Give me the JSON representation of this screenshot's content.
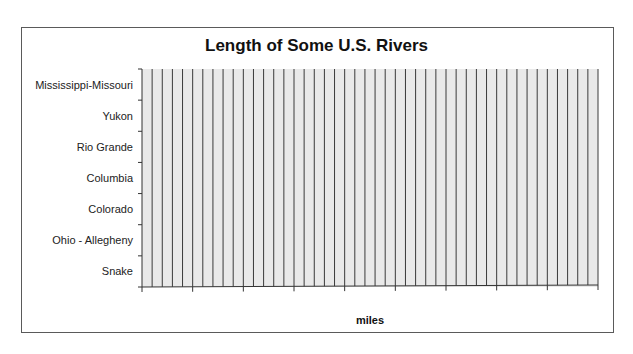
{
  "chart_data": {
    "type": "bar",
    "orientation": "horizontal",
    "title": "Length of Some U.S. Rivers",
    "xlabel": "miles",
    "ylabel": "",
    "categories": [
      "Mississippi-Missouri",
      "Yukon",
      "Rio Grande",
      "Columbia",
      "Colorado",
      "Ohio - Allegheny",
      "Snake"
    ],
    "values": [
      null,
      null,
      null,
      null,
      null,
      null,
      null
    ],
    "x_tick_labels": [],
    "x_major_intervals": 9,
    "x_minor_gridlines_per_major": 5,
    "grid": true,
    "legend": null,
    "plot_background": "#e9e9e9",
    "gridline_color": "#3a3a3a"
  }
}
